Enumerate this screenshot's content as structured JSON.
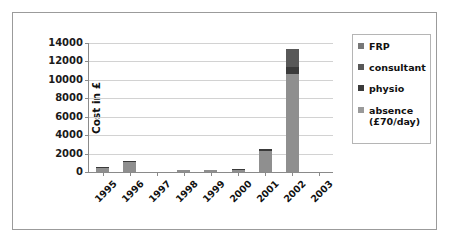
{
  "chart_data": {
    "type": "bar",
    "stacked": true,
    "title": "",
    "xlabel": "",
    "ylabel": "Cost in £",
    "ylim": [
      0,
      14000
    ],
    "ytick_step": 2000,
    "yticks": [
      0,
      2000,
      4000,
      6000,
      8000,
      10000,
      12000,
      14000
    ],
    "ytick_labels": [
      "0",
      "2000",
      "4000",
      "6000",
      "8000",
      "10000",
      "12000",
      "14000"
    ],
    "grid": true,
    "legend_position": "right",
    "categories": [
      "1995",
      "1996",
      "1997",
      "1998",
      "1999",
      "2000",
      "2001",
      "2002",
      "2003"
    ],
    "series": [
      {
        "name": "absence (£70/day)",
        "color": "#8f8f8f",
        "values": [
          420,
          1050,
          0,
          210,
          230,
          230,
          2310,
          10600,
          0
        ]
      },
      {
        "name": "physio",
        "color": "#3a3a3a",
        "values": [
          160,
          170,
          0,
          40,
          40,
          50,
          170,
          800,
          0
        ]
      },
      {
        "name": "consultant",
        "color": "#585858",
        "values": [
          0,
          0,
          0,
          0,
          0,
          0,
          0,
          2000,
          0
        ]
      },
      {
        "name": "FRP",
        "color": "#777777",
        "values": [
          0,
          0,
          0,
          0,
          0,
          0,
          0,
          0,
          0
        ]
      }
    ],
    "totals": [
      580,
      1220,
      0,
      250,
      270,
      280,
      2480,
      13400,
      0
    ]
  },
  "legend": {
    "items": [
      {
        "label": "FRP",
        "color": "#777777"
      },
      {
        "label": "consultant",
        "color": "#585858"
      },
      {
        "label": "physio",
        "color": "#3a3a3a"
      },
      {
        "label": "absence",
        "label2": "(£70/day)",
        "color": "#9a9a9a"
      }
    ]
  },
  "axis": {
    "y_title": "Cost in £"
  }
}
